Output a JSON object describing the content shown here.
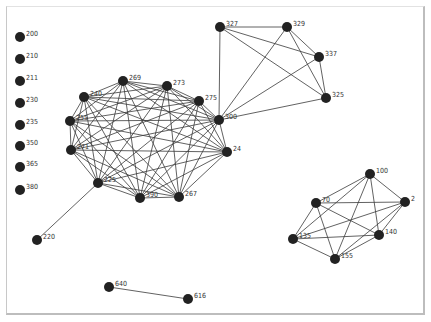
{
  "graph": {
    "node_color": "#222222",
    "edge_color": "#3a3a3a",
    "node_radius": 5,
    "nodes": [
      {
        "id": "200",
        "x": 20,
        "y": 37
      },
      {
        "id": "210",
        "x": 20,
        "y": 59
      },
      {
        "id": "211",
        "x": 20,
        "y": 81
      },
      {
        "id": "230",
        "x": 20,
        "y": 103
      },
      {
        "id": "235",
        "x": 20,
        "y": 125
      },
      {
        "id": "350",
        "x": 20,
        "y": 146
      },
      {
        "id": "365",
        "x": 20,
        "y": 167
      },
      {
        "id": "380",
        "x": 20,
        "y": 190
      },
      {
        "id": "240",
        "x": 84,
        "y": 97
      },
      {
        "id": "269",
        "x": 123,
        "y": 81
      },
      {
        "id": "273",
        "x": 167,
        "y": 86
      },
      {
        "id": "275",
        "x": 199,
        "y": 101
      },
      {
        "id": "300",
        "x": 219,
        "y": 120
      },
      {
        "id": "24",
        "x": 227,
        "y": 152
      },
      {
        "id": "267",
        "x": 179,
        "y": 197
      },
      {
        "id": "390",
        "x": 140,
        "y": 198
      },
      {
        "id": "225",
        "x": 98,
        "y": 183
      },
      {
        "id": "271",
        "x": 71,
        "y": 150
      },
      {
        "id": "255",
        "x": 70,
        "y": 121
      },
      {
        "id": "327",
        "x": 220,
        "y": 27
      },
      {
        "id": "329",
        "x": 287,
        "y": 27
      },
      {
        "id": "337",
        "x": 319,
        "y": 57
      },
      {
        "id": "325",
        "x": 326,
        "y": 98
      },
      {
        "id": "100",
        "x": 370,
        "y": 174
      },
      {
        "id": "2",
        "x": 405,
        "y": 202
      },
      {
        "id": "70",
        "x": 316,
        "y": 203
      },
      {
        "id": "140",
        "x": 379,
        "y": 235
      },
      {
        "id": "135",
        "x": 293,
        "y": 239
      },
      {
        "id": "155",
        "x": 335,
        "y": 259
      },
      {
        "id": "220",
        "x": 37,
        "y": 240
      },
      {
        "id": "640",
        "x": 109,
        "y": 287
      },
      {
        "id": "616",
        "x": 188,
        "y": 299
      }
    ],
    "cliques": [
      [
        "240",
        "269",
        "273",
        "275",
        "300",
        "24",
        "267",
        "390",
        "225",
        "271",
        "255"
      ],
      [
        "327",
        "329",
        "337",
        "325",
        "300"
      ],
      [
        "100",
        "2",
        "70",
        "140",
        "135",
        "155"
      ]
    ],
    "edges": [
      [
        "220",
        "225"
      ],
      [
        "640",
        "616"
      ]
    ]
  }
}
